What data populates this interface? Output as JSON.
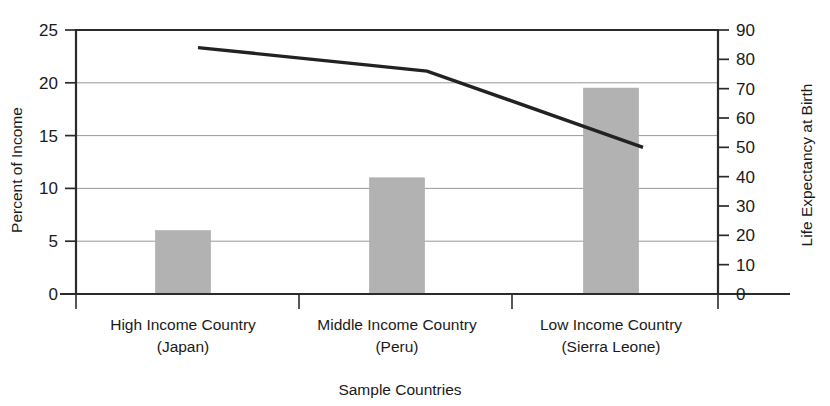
{
  "chart_data": {
    "type": "bar",
    "title": "",
    "subtitle": "",
    "xlabel": "Sample Countries",
    "ylabel": "Percent of Income",
    "y2label": "Life Expectancy at Birth",
    "categories": [
      "High Income Country",
      "Middle Income Country",
      "Low Income Country"
    ],
    "category_sublabels": [
      "(Japan)",
      "(Peru)",
      "(Sierra Leone)"
    ],
    "grid": true,
    "legend": "none",
    "ylim": [
      0,
      25
    ],
    "y2lim": [
      0,
      90
    ],
    "yticks": [
      0,
      5,
      10,
      15,
      20,
      25
    ],
    "y2ticks": [
      0,
      10,
      20,
      30,
      40,
      50,
      60,
      70,
      80,
      90
    ],
    "ytick_labels": [
      "0",
      "5",
      "10",
      "15",
      "20",
      "25"
    ],
    "y2tick_labels": [
      "0",
      "10",
      "20",
      "30",
      "40",
      "50",
      "60",
      "70",
      "80",
      "90"
    ],
    "series": [
      {
        "name": "Percent of Income",
        "type": "bar",
        "axis": "left",
        "color": "#b2b2b2",
        "values": [
          6,
          11,
          19.5
        ]
      },
      {
        "name": "Life Expectancy at Birth",
        "type": "line",
        "axis": "right",
        "color": "#222222",
        "values": [
          84,
          76,
          50
        ]
      }
    ]
  },
  "axes": {
    "left_title": "Percent of Income",
    "right_title": "Life Expectancy at Birth",
    "bottom_title": "Sample Countries"
  }
}
